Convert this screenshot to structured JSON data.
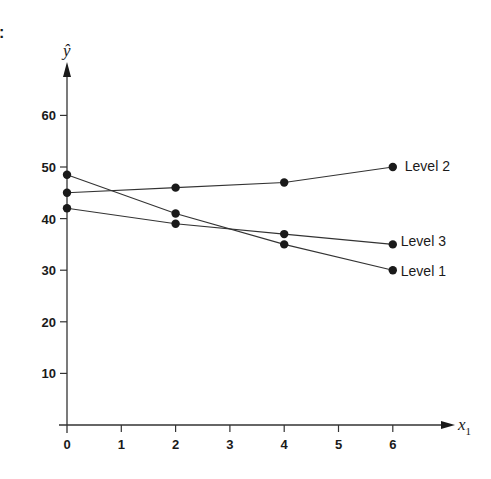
{
  "panel_marker": ":",
  "chart_data": {
    "type": "line",
    "title": "",
    "xlabel": "x1",
    "xlabel_main": "x",
    "xlabel_sub": "1",
    "ylabel": "ŷ",
    "xlim": [
      0,
      7
    ],
    "ylim": [
      0,
      70
    ],
    "grid": false,
    "legend_position": "inline-right",
    "x_ticks": [
      0,
      1,
      2,
      3,
      4,
      5,
      6
    ],
    "y_ticks": [
      10,
      20,
      30,
      40,
      50,
      60
    ],
    "x": [
      0,
      2,
      4,
      6
    ],
    "series": [
      {
        "name": "Level 1",
        "values": [
          48.5,
          41,
          35,
          30
        ]
      },
      {
        "name": "Level 2",
        "values": [
          45,
          46,
          47,
          50
        ]
      },
      {
        "name": "Level 3",
        "values": [
          42,
          39,
          37,
          35
        ]
      }
    ],
    "colors": {
      "line": "#333333",
      "marker": "#1a1a1a",
      "text": "#1a1a1a"
    }
  }
}
